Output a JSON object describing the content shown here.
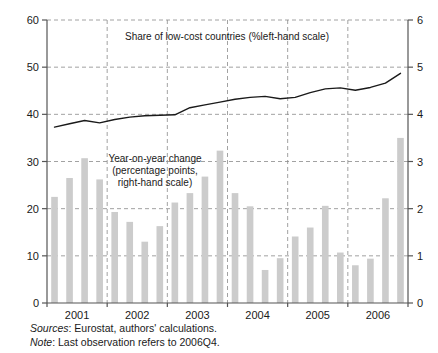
{
  "chart_data": {
    "type": "bar",
    "title": "",
    "categories": [
      "2001Q1",
      "2001Q2",
      "2001Q3",
      "2001Q4",
      "2002Q1",
      "2002Q2",
      "2002Q3",
      "2002Q4",
      "2003Q1",
      "2003Q2",
      "2003Q3",
      "2003Q4",
      "2004Q1",
      "2004Q2",
      "2004Q3",
      "2004Q4",
      "2005Q1",
      "2005Q2",
      "2005Q3",
      "2005Q4",
      "2006Q1",
      "2006Q2",
      "2006Q3",
      "2006Q4"
    ],
    "series": [
      {
        "name": "Year-on-year change (percentage points, right-hand scale)",
        "type": "bar",
        "axis": "right",
        "color": "#cccccc",
        "values": [
          2.25,
          2.65,
          3.07,
          2.62,
          1.93,
          1.72,
          1.3,
          1.63,
          2.13,
          2.33,
          2.68,
          3.23,
          2.33,
          2.05,
          0.7,
          0.95,
          1.41,
          1.6,
          2.06,
          1.07,
          0.8,
          0.94,
          2.22,
          3.5
        ]
      },
      {
        "name": "Share of low-cost countries (% left-hand scale)",
        "type": "line",
        "axis": "left",
        "color": "#1a1a1a",
        "values": [
          37.3,
          38.0,
          38.7,
          38.2,
          38.9,
          39.4,
          39.7,
          39.8,
          39.9,
          41.4,
          42.0,
          42.6,
          43.2,
          43.6,
          43.8,
          43.3,
          43.6,
          44.6,
          45.4,
          45.6,
          45.1,
          45.7,
          46.6,
          48.7
        ]
      }
    ],
    "xlabel": "",
    "ylabel": "",
    "ylim": [
      0,
      60
    ],
    "ylim_right": [
      0,
      6
    ],
    "yticks": [
      0,
      10,
      20,
      30,
      40,
      50,
      60
    ],
    "yticks_right": [
      0,
      1,
      2,
      3,
      4,
      5,
      6
    ],
    "xticks": [
      "2001",
      "2002",
      "2003",
      "2004",
      "2005",
      "2006"
    ],
    "grid": true,
    "grid_style": "dashed",
    "legend_position": "inline-annotations"
  },
  "annotations": {
    "line_label": "Share of low-cost countries (%left-hand scale)",
    "bar_label_line1": "Year-on-year change",
    "bar_label_line2": "(percentage points,",
    "bar_label_line3": "right-hand scale)"
  },
  "axis": {
    "left_ticks": [
      "60",
      "50",
      "40",
      "30",
      "20",
      "10",
      "0"
    ],
    "right_ticks": [
      "6",
      "5",
      "4",
      "3",
      "2",
      "1",
      "0"
    ],
    "x_ticks": [
      "2001",
      "2002",
      "2003",
      "2004",
      "2005",
      "2006"
    ]
  },
  "footnotes": {
    "sources_label": "Sources",
    "sources_text": ": Eurostat, authors' calculations.",
    "note_label": "Note",
    "note_text": ": Last observation refers to 2006Q4."
  }
}
